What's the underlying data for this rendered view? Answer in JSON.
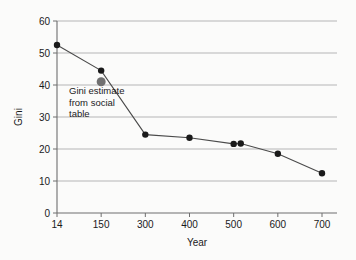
{
  "chart_data": {
    "type": "line",
    "title": "",
    "xlabel": "Year",
    "ylabel": "Gini",
    "x_tick_labels": [
      "14",
      "150",
      "300",
      "400",
      "500",
      "600",
      "700"
    ],
    "y_tick_labels": [
      "0",
      "10",
      "20",
      "30",
      "40",
      "50",
      "60"
    ],
    "ylim": [
      0,
      60
    ],
    "grid": "horizontal",
    "legend": "none",
    "series": [
      {
        "name": "Gini",
        "marker": "filled-circle",
        "color": "#1a1a1a",
        "points": [
          {
            "x_label": "14",
            "x_pos": 0,
            "y": 52.5
          },
          {
            "x_label": "150",
            "x_pos": 1,
            "y": 44.5
          },
          {
            "x_label": "300",
            "x_pos": 2,
            "y": 24.5
          },
          {
            "x_label": "400",
            "x_pos": 3,
            "y": 23.5
          },
          {
            "x_label": "500",
            "x_pos": 4,
            "y": 21.6
          },
          {
            "x_label": "520",
            "x_pos": 4.16,
            "y": 21.7
          },
          {
            "x_label": "600",
            "x_pos": 5,
            "y": 18.5
          },
          {
            "x_label": "700",
            "x_pos": 6,
            "y": 12.4
          }
        ]
      }
    ],
    "extra_points": [
      {
        "name": "Gini estimate from social table",
        "x_label": "150",
        "x_pos": 1,
        "y": 41.0,
        "marker": "filled-circle",
        "color": "#707070",
        "size": 9
      }
    ],
    "annotations": [
      {
        "name": "social-table-annotation",
        "lines": [
          "Gini estimate",
          "from social",
          "table"
        ],
        "x_px": 69,
        "y_px": 94
      }
    ],
    "colors": {
      "line": "#4a4a4a",
      "marker": "#1a1a1a",
      "estimate_marker": "#707070",
      "gridline": "#9a9a9a",
      "axis": "#6e6e6e",
      "background": "#fbfbfa",
      "text": "#1a1a1a"
    }
  }
}
